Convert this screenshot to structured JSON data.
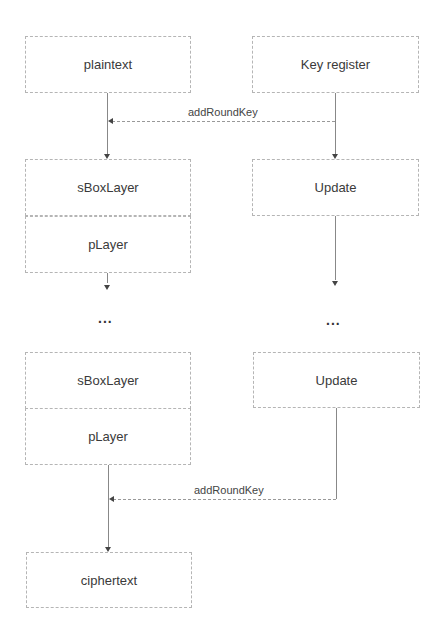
{
  "diagram": {
    "left_column": {
      "plaintext": "plaintext",
      "sbox1": "sBoxLayer",
      "player1": "pLayer",
      "ellipsis": "...",
      "sbox2": "sBoxLayer",
      "player2": "pLayer",
      "ciphertext": "ciphertext"
    },
    "right_column": {
      "key_register": "Key register",
      "update1": "Update",
      "ellipsis": "...",
      "update2": "Update"
    },
    "edges": {
      "add_round_key_1": "addRoundKey",
      "add_round_key_2": "addRoundKey"
    }
  }
}
